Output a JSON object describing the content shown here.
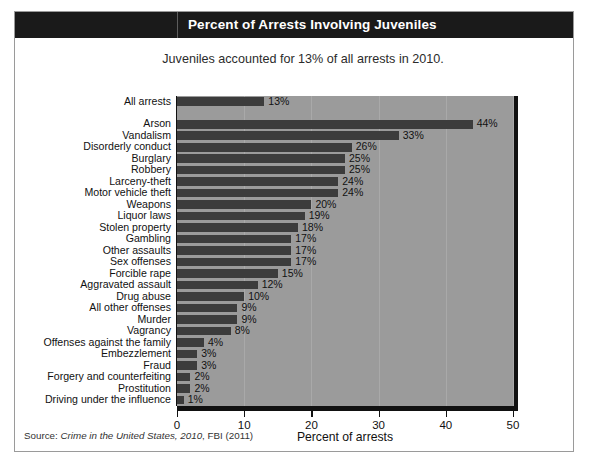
{
  "title": "Percent of Arrests Involving Juveniles",
  "subtitle": "Juveniles accounted for 13% of all arrests in 2010.",
  "source": {
    "prefix": "Source: ",
    "italic": "Crime in the United States, 2010",
    "suffix": ", FBI (2011)"
  },
  "colors": {
    "title_band": "#1a1a1a",
    "title_text": "#ffffff",
    "plot_background": "#9b9b9b",
    "bar": "#3c3c3c",
    "axis": "#111111",
    "gridline": "#a9a9a9",
    "frame": "#9a9a9a"
  },
  "chart_data": {
    "type": "bar",
    "orientation": "horizontal",
    "title": "Percent of Arrests Involving Juveniles",
    "subtitle": "Juveniles accounted for 13% of all arrests in 2010.",
    "xlabel": "Percent of arrests",
    "ylabel": "",
    "xlim": [
      0,
      50
    ],
    "xticks": [
      0,
      10,
      20,
      30,
      40,
      50
    ],
    "xtick_labels": [
      "0",
      "10",
      "20",
      "30",
      "40",
      "50"
    ],
    "grid": true,
    "legend": "none",
    "value_label_suffix": "%",
    "summary_row": {
      "category": "All arrests",
      "value": 13,
      "label": "13%"
    },
    "categories": [
      "Arson",
      "Vandalism",
      "Disorderly conduct",
      "Burglary",
      "Robbery",
      "Larceny-theft",
      "Motor vehicle theft",
      "Weapons",
      "Liquor laws",
      "Stolen property",
      "Gambling",
      "Other assaults",
      "Sex offenses",
      "Forcible rape",
      "Aggravated assault",
      "Drug abuse",
      "All other offenses",
      "Murder",
      "Vagrancy",
      "Offenses against the family",
      "Embezzlement",
      "Fraud",
      "Forgery and counterfeiting",
      "Prostitution",
      "Driving under the influence"
    ],
    "values": [
      44,
      33,
      26,
      25,
      25,
      24,
      24,
      20,
      19,
      18,
      17,
      17,
      17,
      15,
      12,
      10,
      9,
      9,
      8,
      4,
      3,
      3,
      2,
      2,
      1
    ],
    "value_labels": [
      "44%",
      "33%",
      "26%",
      "25%",
      "25%",
      "24%",
      "24%",
      "20%",
      "19%",
      "18%",
      "17%",
      "17%",
      "17%",
      "15%",
      "12%",
      "10%",
      "9%",
      "9%",
      "8%",
      "4%",
      "3%",
      "3%",
      "2%",
      "2%",
      "1%"
    ]
  }
}
